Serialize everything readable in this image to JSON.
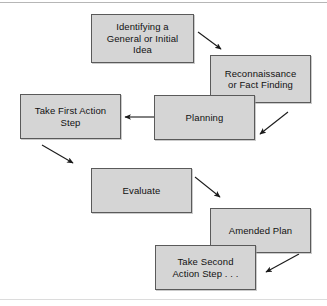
{
  "diagram": {
    "background_color": "#ffffff",
    "node_fill_color": "#d5d5d5",
    "node_border_color": "#5a5a5a",
    "text_color": "#111111",
    "arrow_color": "#1a1a1a",
    "rule_color": "#b6b6b6",
    "nodes": [
      {
        "id": "identifying-idea",
        "label": "Identifying a\nGeneral or Initial\nIdea",
        "x": 91,
        "y": 14,
        "w": 103,
        "h": 49
      },
      {
        "id": "reconnaissance",
        "label": "Reconnaissance\nor Fact Finding",
        "x": 210,
        "y": 55,
        "w": 101,
        "h": 48
      },
      {
        "id": "planning",
        "label": "Planning",
        "x": 154,
        "y": 95,
        "w": 101,
        "h": 45
      },
      {
        "id": "take-first-action-step",
        "label": "Take First Action\nStep",
        "x": 20,
        "y": 94,
        "w": 101,
        "h": 45
      },
      {
        "id": "evaluate",
        "label": "Evaluate",
        "x": 91,
        "y": 168,
        "w": 101,
        "h": 45
      },
      {
        "id": "amended-plan",
        "label": "Amended Plan",
        "x": 210,
        "y": 208,
        "w": 101,
        "h": 45
      },
      {
        "id": "take-second-action-step",
        "label": "Take Second\nAction Step . . .",
        "x": 155,
        "y": 245,
        "w": 101,
        "h": 45
      }
    ],
    "arrows": [
      {
        "id": "idea-to-reconnaissance",
        "from": "identifying-idea",
        "to": "reconnaissance",
        "x1": 198,
        "y1": 32,
        "x2": 222,
        "y2": 50,
        "style": "diagonal-down-right"
      },
      {
        "id": "reconnaissance-to-planning",
        "from": "reconnaissance",
        "to": "planning",
        "x2": 258,
        "y2": 135,
        "x1": 288,
        "y1": 112,
        "style": "diagonal-down-left"
      },
      {
        "id": "planning-to-first-action",
        "from": "planning",
        "to": "take-first-action-step",
        "x1": 153,
        "y1": 117,
        "x2": 124,
        "y2": 117,
        "style": "horizontal-left"
      },
      {
        "id": "first-action-to-evaluate",
        "from": "take-first-action-step",
        "to": "evaluate",
        "x1": 43,
        "y1": 146,
        "x2": 74,
        "y2": 163,
        "style": "diagonal-down-right"
      },
      {
        "id": "evaluate-to-amended-plan",
        "from": "evaluate",
        "to": "amended-plan",
        "x1": 194,
        "y1": 176,
        "x2": 220,
        "y2": 197,
        "style": "diagonal-down-right"
      },
      {
        "id": "amended-plan-to-second-action",
        "from": "amended-plan",
        "to": "take-second-action-step",
        "x1": 299,
        "y1": 254,
        "x2": 265,
        "y2": 273,
        "style": "diagonal-down-left"
      }
    ]
  }
}
